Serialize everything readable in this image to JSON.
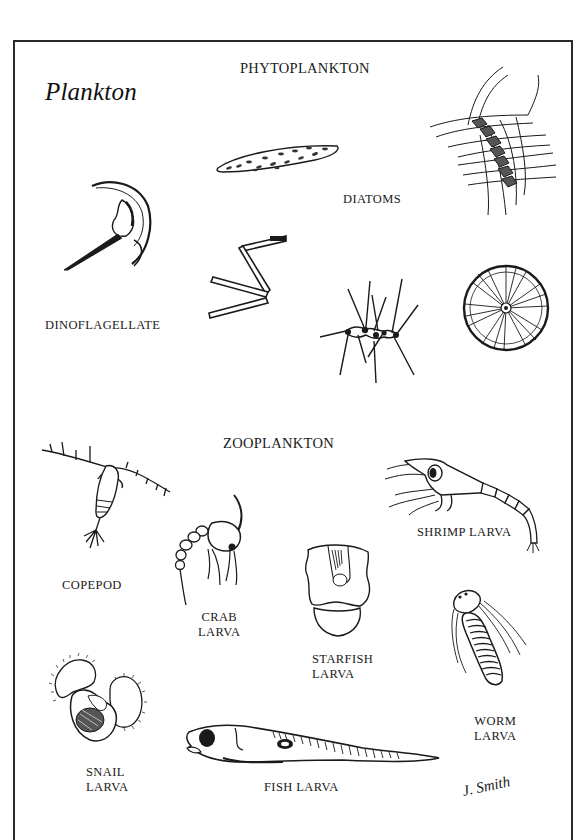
{
  "title": "Plankton",
  "sections": {
    "phytoplankton": "PHYTOPLANKTON",
    "zooplankton": "ZOOPLANKTON"
  },
  "phytoplankton": {
    "items": [
      {
        "id": "dinoflagellate",
        "label": "DINOFLAGELLATE"
      },
      {
        "id": "diatoms",
        "label": "DIATOMS"
      }
    ],
    "diatom_illustrations": [
      "pennate-diatom",
      "chain-diatom",
      "zigzag-diatom",
      "spiny-colony-diatom",
      "centric-disc-diatom"
    ]
  },
  "zooplankton": {
    "items": [
      {
        "id": "copepod",
        "label": "COPEPOD"
      },
      {
        "id": "crab-larva",
        "label_line1": "CRAB",
        "label_line2": "LARVA"
      },
      {
        "id": "shrimp-larva",
        "label": "SHRIMP LARVA"
      },
      {
        "id": "starfish-larva",
        "label_line1": "STARFISH",
        "label_line2": "LARVA"
      },
      {
        "id": "worm-larva",
        "label_line1": "WORM",
        "label_line2": "LARVA"
      },
      {
        "id": "snail-larva",
        "label_line1": "SNAIL",
        "label_line2": "LARVA"
      },
      {
        "id": "fish-larva",
        "label": "FISH LARVA"
      }
    ]
  },
  "signature": "J. Smith",
  "colors": {
    "ink": "#1a1a1a",
    "frame": "#2a2a2a",
    "background": "#ffffff"
  }
}
